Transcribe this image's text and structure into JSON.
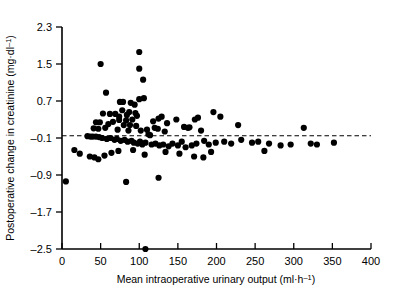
{
  "chart_data": {
    "type": "scatter",
    "title": "",
    "xlabel": "Mean intraoperative urinary output (ml·h⁻¹)",
    "ylabel": "Postoperative change in creatinine (mg·dl⁻¹)",
    "xlabel_parts": {
      "text": "Mean intraoperative urinary output (ml·h",
      "sup": "–1",
      "tail": ")"
    },
    "ylabel_parts": {
      "text": "Postoperative change in creatinine (mg·dl",
      "sup": "–1",
      "tail": ")"
    },
    "xlim": [
      0,
      400
    ],
    "ylim": [
      -2.5,
      2.3
    ],
    "xticks": [
      0,
      50,
      100,
      150,
      200,
      250,
      300,
      350,
      400
    ],
    "xtick_labels": [
      "0",
      "50",
      "100",
      "150",
      "200",
      "250",
      "300",
      "350",
      "400"
    ],
    "yticks": [
      -2.5,
      -1.7,
      -0.9,
      -0.1,
      0.7,
      1.5,
      2.3
    ],
    "ytick_labels": [
      "–2.5",
      "–1.7",
      "–0.9",
      "–0.1",
      "0.7",
      "1.5",
      "2.3"
    ],
    "grid": false,
    "legend": null,
    "marker": {
      "shape": "circle",
      "color": "#000000",
      "size": 3.1
    },
    "reference_line": {
      "name": "regression-reference-line",
      "orientation": "horizontal",
      "y": -0.05,
      "style": "dashed",
      "color": "#000000",
      "x_from": 0,
      "x_to": 400
    },
    "points": [
      [
        50,
        1.5
      ],
      [
        100,
        1.76
      ],
      [
        100,
        1.4
      ],
      [
        105,
        1.16
      ],
      [
        57,
        0.88
      ],
      [
        100,
        0.74
      ],
      [
        106,
        0.76
      ],
      [
        75,
        0.68
      ],
      [
        79,
        0.68
      ],
      [
        89,
        0.66
      ],
      [
        94,
        0.62
      ],
      [
        78,
        0.5
      ],
      [
        87,
        0.46
      ],
      [
        95,
        0.44
      ],
      [
        53,
        0.43
      ],
      [
        62,
        0.42
      ],
      [
        69,
        0.42
      ],
      [
        84,
        0.4
      ],
      [
        97,
        0.38
      ],
      [
        74,
        0.36
      ],
      [
        74,
        0.29
      ],
      [
        83,
        0.28
      ],
      [
        91,
        0.3
      ],
      [
        44,
        0.24
      ],
      [
        49,
        0.24
      ],
      [
        66,
        0.25
      ],
      [
        60,
        0.2
      ],
      [
        80,
        0.18
      ],
      [
        88,
        0.18
      ],
      [
        96,
        0.16
      ],
      [
        41,
        0.11
      ],
      [
        47,
        0.1
      ],
      [
        56,
        0.12
      ],
      [
        72,
        0.08
      ],
      [
        86,
        0.06
      ],
      [
        102,
        0.06
      ],
      [
        110,
        0.08
      ],
      [
        118,
        0.26
      ],
      [
        125,
        0.32
      ],
      [
        129,
        0.36
      ],
      [
        120,
        0.12
      ],
      [
        124,
        0.1
      ],
      [
        136,
        0.22
      ],
      [
        133,
        0.04
      ],
      [
        148,
        0.3
      ],
      [
        158,
        0.14
      ],
      [
        163,
        0.12
      ],
      [
        165,
        0.13
      ],
      [
        172,
        0.3
      ],
      [
        176,
        0.34
      ],
      [
        180,
        0.06
      ],
      [
        196,
        0.46
      ],
      [
        205,
        0.36
      ],
      [
        228,
        0.18
      ],
      [
        112,
        -0.02
      ],
      [
        114,
        -0.04
      ],
      [
        33,
        -0.06
      ],
      [
        37,
        -0.07
      ],
      [
        40,
        -0.07
      ],
      [
        44,
        -0.07
      ],
      [
        48,
        -0.08
      ],
      [
        52,
        -0.1
      ],
      [
        58,
        -0.12
      ],
      [
        63,
        -0.1
      ],
      [
        68,
        -0.14
      ],
      [
        71,
        -0.12
      ],
      [
        76,
        -0.16
      ],
      [
        81,
        -0.14
      ],
      [
        85,
        -0.18
      ],
      [
        90,
        -0.16
      ],
      [
        93,
        -0.2
      ],
      [
        98,
        -0.22
      ],
      [
        101,
        -0.18
      ],
      [
        104,
        -0.24
      ],
      [
        108,
        -0.2
      ],
      [
        116,
        -0.24
      ],
      [
        121,
        -0.22
      ],
      [
        126,
        -0.26
      ],
      [
        131,
        -0.24
      ],
      [
        138,
        -0.28
      ],
      [
        143,
        -0.22
      ],
      [
        150,
        -0.26
      ],
      [
        155,
        -0.18
      ],
      [
        160,
        -0.3
      ],
      [
        168,
        -0.26
      ],
      [
        174,
        -0.22
      ],
      [
        184,
        -0.16
      ],
      [
        190,
        -0.24
      ],
      [
        199,
        -0.2
      ],
      [
        210,
        -0.18
      ],
      [
        219,
        -0.22
      ],
      [
        232,
        -0.14
      ],
      [
        246,
        -0.2
      ],
      [
        254,
        -0.18
      ],
      [
        268,
        -0.22
      ],
      [
        283,
        -0.26
      ],
      [
        296,
        -0.24
      ],
      [
        313,
        0.12
      ],
      [
        322,
        -0.22
      ],
      [
        330,
        -0.24
      ],
      [
        352,
        -0.2
      ],
      [
        16,
        -0.36
      ],
      [
        23,
        -0.44
      ],
      [
        36,
        -0.5
      ],
      [
        42,
        -0.52
      ],
      [
        47,
        -0.56
      ],
      [
        55,
        -0.48
      ],
      [
        64,
        -0.42
      ],
      [
        73,
        -0.38
      ],
      [
        92,
        -0.36
      ],
      [
        107,
        -0.46
      ],
      [
        134,
        -0.4
      ],
      [
        152,
        -0.44
      ],
      [
        171,
        -0.5
      ],
      [
        183,
        -0.52
      ],
      [
        193,
        -0.4
      ],
      [
        262,
        -0.38
      ],
      [
        5,
        -1.04
      ],
      [
        83,
        -1.05
      ],
      [
        125,
        -0.96
      ],
      [
        108,
        -2.5
      ]
    ]
  },
  "axes": {
    "y_axis_name": "y-axis",
    "x_axis_name": "x-axis"
  }
}
